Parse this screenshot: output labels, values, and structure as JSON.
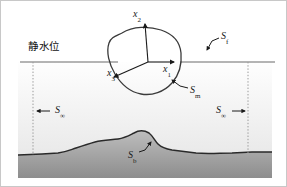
{
  "figure": {
    "title_cjk": "静水位",
    "width": 287,
    "height": 187
  },
  "colors": {
    "background": "#ffffff",
    "line": "#1a1a1a",
    "water_surface": "#6b6b6b",
    "seabed_line": "#2a2a2a",
    "seabed_fill_top": "#b9b9b9",
    "seabed_fill_bottom": "#8f8f8f",
    "water_fill_top": "#fdfdfd",
    "water_fill_bottom": "#ededed",
    "dotted_line": "#9a9a9a",
    "body_outline": "#3a3a3a",
    "frame": "#c8c8c8"
  },
  "labels": {
    "still_water_level": {
      "text": "静水位",
      "x": 28,
      "y": 43
    },
    "axis_x2": {
      "symbol": "x",
      "subscript": "2",
      "x": 133,
      "y": 10
    },
    "axis_x1": {
      "symbol": "x",
      "subscript": "1",
      "x": 163,
      "y": 63
    },
    "axis_x3": {
      "symbol": "x",
      "subscript": "3",
      "x": 107,
      "y": 69
    },
    "surface_free": {
      "symbol": "S",
      "subscript": "f",
      "x": 221,
      "y": 34
    },
    "surface_body": {
      "symbol": "S",
      "subscript": "m",
      "x": 190,
      "y": 88
    },
    "surface_infinity_left": {
      "symbol": "S",
      "subscript": "∞",
      "x": 54,
      "y": 107
    },
    "surface_infinity_right": {
      "symbol": "S",
      "subscript": "∞",
      "x": 216,
      "y": 107
    },
    "surface_bed": {
      "symbol": "S",
      "subscript": "b",
      "x": 128,
      "y": 154
    }
  },
  "geometry": {
    "water_line_y": 62,
    "water_line_x_start": 20,
    "water_line_x_end": 275,
    "dotted_left_x": 33,
    "dotted_right_x": 248,
    "origin": {
      "x": 148,
      "y": 62
    },
    "axis_x2_tip": {
      "x": 145,
      "y": 21
    },
    "axis_x1_tip": {
      "x": 177,
      "y": 62
    },
    "axis_x3_tip": {
      "x": 112,
      "y": 79
    },
    "body_path": "M 122 33 C 133 26 149 26 161 30 C 173 34 180 42 181 53 C 182 64 179 75 172 83 C 164 92 152 96 141 94 C 130 92 121 84 115 74 C 109 64 106 52 109 43 C 111 37 116 36 122 33 Z",
    "seabed_path": "M 18 155 L 42 154 L 58 153 C 66 152 70 150 76 148 C 82 146 88 144 95 142 C 103 140 110 140 118 139 C 125 138 130 135 134 133 C 139 130 144 130 149 133 C 153 136 155 141 158 144 C 161 147 166 149 172 150 C 180 151 188 152 196 153 C 208 154 220 153 232 153 L 252 152 L 272 152 L 272 178 L 18 178 Z",
    "seabed_top_line": "M 18 155 L 42 154 L 58 153 C 66 152 70 150 76 148 C 82 146 88 144 95 142 C 103 140 110 140 118 139 C 125 138 130 135 134 133 C 139 130 144 130 149 133 C 153 136 155 141 158 144 C 161 147 166 149 172 150 C 180 151 188 152 196 153 C 208 154 220 153 232 153 L 252 152 L 272 152"
  },
  "leaders": {
    "sf_leader": "M 219 38 L 212 41 L 207 50",
    "sm_leader": "M 188 88 L 180 86 L 172 80",
    "sb_leader": "M 139 152 L 144 150 L 150 143",
    "sinf_left_arrow": {
      "from_x": 50,
      "from_y": 111,
      "to_x": 36,
      "to_y": 111
    },
    "sinf_right_arrow": {
      "from_x": 232,
      "from_y": 111,
      "to_x": 246,
      "to_y": 111
    }
  }
}
